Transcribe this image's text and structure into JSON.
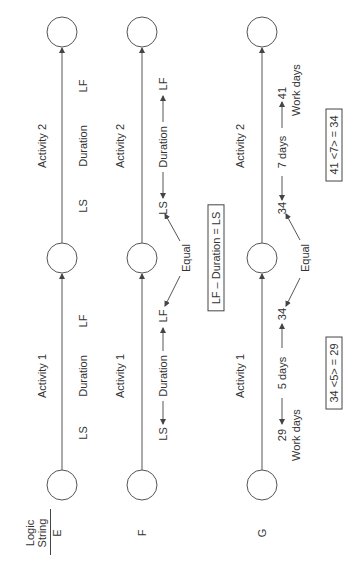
{
  "header": {
    "line1": "Logic",
    "line2": "String"
  },
  "rows": [
    {
      "id": "E",
      "label": "E",
      "activity1": {
        "name": "Activity 1",
        "start": "LS",
        "duration": "Duration",
        "finish": "LF"
      },
      "activity2": {
        "name": "Activity 2",
        "start": "LS",
        "duration": "Duration",
        "finish": "LF"
      }
    },
    {
      "id": "F",
      "label": "F",
      "activity1": {
        "name": "Activity 1",
        "start": "LS",
        "duration": "Duration",
        "finish": "LF"
      },
      "activity2": {
        "name": "Activity 2",
        "start": "LS",
        "duration": "Duration",
        "finish": "LF"
      },
      "equal_label": "Equal",
      "formula": "LF – Duration = LS"
    },
    {
      "id": "G",
      "label": "G",
      "activity1": {
        "name": "Activity 1",
        "start": "29",
        "start_sub": "Work days",
        "duration": "5 days",
        "finish": "34"
      },
      "activity2": {
        "name": "Activity 2",
        "start": "34",
        "duration": "7 days",
        "finish": "41",
        "finish_sub": "Work days"
      },
      "equal_label": "Equal",
      "formula1": "34 <5> = 29",
      "formula2": "41 <7> = 34"
    }
  ],
  "colors": {
    "line": "#555555",
    "text": "#333333",
    "background": "#ffffff"
  }
}
